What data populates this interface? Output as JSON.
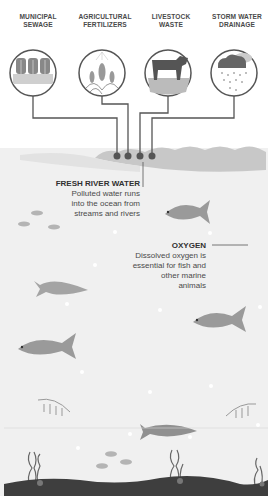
{
  "sources": [
    {
      "label": "MUNICIPAL SEWAGE",
      "line1": "MUNICIPAL",
      "line2": "SEWAGE",
      "icon": "sewage-plant-icon"
    },
    {
      "label": "AGRICULTURAL FERTILIZERS",
      "line1": "AGRICULTURAL",
      "line2": "FERTILIZERS",
      "icon": "crop-spray-icon"
    },
    {
      "label": "LIVESTOCK WASTE",
      "line1": "LIVESTOCK",
      "line2": "WASTE",
      "icon": "cow-icon"
    },
    {
      "label": "STORM WATER DRAINAGE",
      "line1": "STORM WATER",
      "line2": "DRAINAGE",
      "icon": "rain-cloud-icon"
    }
  ],
  "callouts": {
    "fresh_river_water": {
      "title": "FRESH RIVER WATER",
      "lines": [
        "Polluted water runs",
        "into the ocean from",
        "streams and rivers"
      ]
    },
    "oxygen": {
      "title": "OXYGEN",
      "lines": [
        "Dissolved oxygen is",
        "essential for fish and",
        "other marine",
        "animals"
      ]
    }
  },
  "colors": {
    "ocean": "#f0f0f0",
    "river_water": "#c9c9c9",
    "pipe": "#555555",
    "fish": "#9a9a9a",
    "seabed": "#3e3e3e",
    "text_dark": "#303030"
  }
}
